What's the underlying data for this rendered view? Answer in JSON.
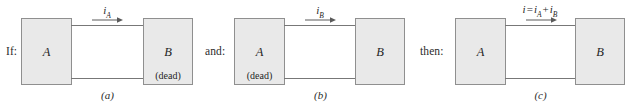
{
  "figure": {
    "colors": {
      "block_fill": "#e9e9e9",
      "block_stroke": "#8f8f8f",
      "wire": "#777777",
      "text": "#1f1f1f",
      "background": "#ffffff"
    },
    "panels": [
      {
        "id": "a",
        "lead_text": "If:",
        "left_block": {
          "label": "A",
          "dead": ""
        },
        "right_block": {
          "label": "B",
          "dead": "(dead)"
        },
        "current": {
          "symbol": "i",
          "subscript": "A",
          "full": "i_A",
          "direction": "right"
        },
        "caption": "(a)"
      },
      {
        "id": "b",
        "lead_text": "and:",
        "left_block": {
          "label": "A",
          "dead": "(dead)"
        },
        "right_block": {
          "label": "B",
          "dead": ""
        },
        "current": {
          "symbol": "i",
          "subscript": "B",
          "full": "i_B",
          "direction": "right"
        },
        "caption": "(b)"
      },
      {
        "id": "c",
        "lead_text": "then:",
        "left_block": {
          "label": "A",
          "dead": ""
        },
        "right_block": {
          "label": "B",
          "dead": ""
        },
        "current": {
          "symbol": "i",
          "equals": "=",
          "term1": "i",
          "sub1": "A",
          "plus": "+",
          "term2": "i",
          "sub2": "B",
          "full": "i = i_A + i_B",
          "direction": "right"
        },
        "caption": "(c)"
      }
    ]
  }
}
